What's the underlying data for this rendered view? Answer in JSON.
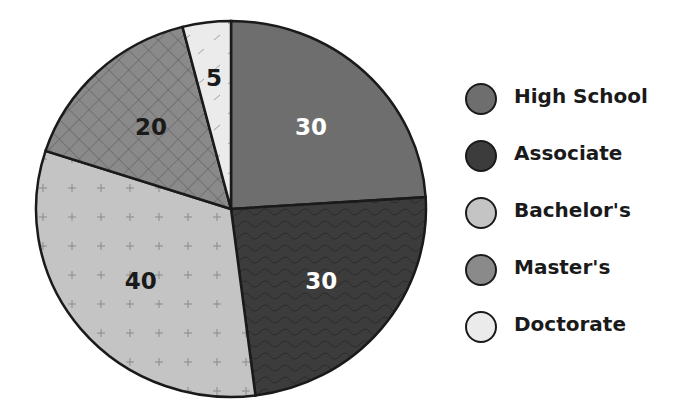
{
  "chart_data": {
    "type": "pie",
    "title": "",
    "categories": [
      "High School",
      "Associate",
      "Bachelor's",
      "Master's",
      "Doctorate"
    ],
    "values": [
      30,
      30,
      40,
      20,
      5
    ],
    "labels": [
      "30",
      "30",
      "40",
      "20",
      "5"
    ],
    "colors": [
      "#6e6e6e",
      "#3c3c3c",
      "#c4c4c4",
      "#8a8a8a",
      "#ebebeb"
    ],
    "patterns": [
      "speckle",
      "wavy",
      "plus",
      "crosshatch",
      "dashes"
    ],
    "label_colors": [
      "#ffffff",
      "#ffffff",
      "#1a1a1a",
      "#1a1a1a",
      "#1a1a1a"
    ],
    "legend_position": "right"
  },
  "legend": {
    "items": [
      {
        "label": "High School",
        "color": "#6e6e6e"
      },
      {
        "label": "Associate",
        "color": "#3c3c3c"
      },
      {
        "label": "Bachelor's",
        "color": "#c4c4c4"
      },
      {
        "label": "Master's",
        "color": "#8a8a8a"
      },
      {
        "label": "Doctorate",
        "color": "#ebebeb"
      }
    ]
  }
}
